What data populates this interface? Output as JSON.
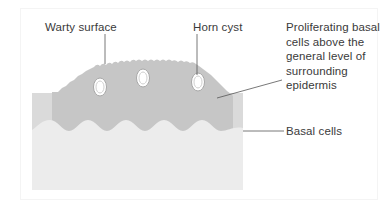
{
  "figure": {
    "type": "anatomical-cross-section"
  },
  "labels": {
    "warty_surface": "Warty surface",
    "horn_cyst": "Horn cyst",
    "proliferating": "Proliferating basal\ncells above the\ngeneral level of\nsurrounding\nepidermis",
    "basal_cells": "Basal cells"
  },
  "colors": {
    "lesion": "#c6c6c6",
    "epidermis": "#dadada",
    "dermis": "#ececec",
    "cyst_fill": "#ffffff",
    "cyst_ring": "#b0b0b0",
    "leader": "#555555",
    "text": "#3a3a3a"
  },
  "horn_cysts": [
    {
      "cx": 100,
      "cy": 87,
      "rx": 6,
      "ry": 9
    },
    {
      "cx": 143,
      "cy": 78,
      "rx": 6,
      "ry": 9
    },
    {
      "cx": 198,
      "cy": 82,
      "rx": 6,
      "ry": 9
    }
  ]
}
